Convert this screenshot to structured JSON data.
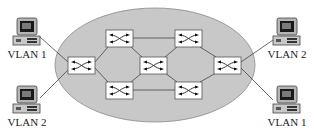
{
  "diagram": {
    "title": "",
    "cloud": {
      "shape": "ellipse",
      "fill": "#c8c8c8",
      "stroke": "#8a8a8a"
    },
    "switches": [
      {
        "id": "sw-left",
        "x": 68,
        "y": 57
      },
      {
        "id": "sw-top-left",
        "x": 106,
        "y": 30
      },
      {
        "id": "sw-bottom-left",
        "x": 106,
        "y": 82
      },
      {
        "id": "sw-center",
        "x": 140,
        "y": 57
      },
      {
        "id": "sw-top-right",
        "x": 175,
        "y": 30
      },
      {
        "id": "sw-bottom-right",
        "x": 175,
        "y": 82
      },
      {
        "id": "sw-right",
        "x": 214,
        "y": 57
      }
    ],
    "hosts": [
      {
        "id": "host-left-top",
        "label": "VLAN 1"
      },
      {
        "id": "host-left-bottom",
        "label": "VLAN 2"
      },
      {
        "id": "host-right-top",
        "label": "VLAN 2"
      },
      {
        "id": "host-right-bottom",
        "label": "VLAN 1"
      }
    ],
    "icons": {
      "switch": "switch-icon",
      "host": "desktop-computer-icon"
    }
  }
}
